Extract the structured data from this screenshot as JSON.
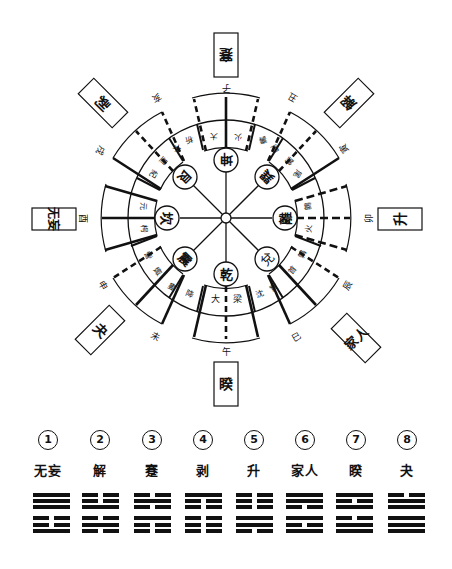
{
  "diagram": {
    "center_trigrams": [
      {
        "name": "坤",
        "position": "top"
      },
      {
        "name": "巽",
        "position": "upper-right"
      },
      {
        "name": "離",
        "position": "right"
      },
      {
        "name": "兌",
        "position": "lower-right"
      },
      {
        "name": "乾",
        "position": "bottom"
      },
      {
        "name": "震",
        "position": "lower-left"
      },
      {
        "name": "坎",
        "position": "left"
      },
      {
        "name": "艮",
        "position": "upper-left"
      }
    ],
    "station_ring": [
      {
        "chars": [
          "大",
          "火"
        ],
        "position": "top"
      },
      {
        "chars": [
          "壽",
          "星"
        ],
        "position": "upper-right-1"
      },
      {
        "chars": [
          "鶉",
          "尾"
        ],
        "position": "upper-right-2"
      },
      {
        "chars": [
          "鶉",
          "火"
        ],
        "position": "right"
      },
      {
        "chars": [
          "鶉",
          "首"
        ],
        "position": "lower-right-1"
      },
      {
        "chars": [
          "實",
          "沈"
        ],
        "position": "lower-right-2"
      },
      {
        "chars": [
          "大",
          "梁"
        ],
        "position": "bottom"
      },
      {
        "chars": [
          "降",
          "婁"
        ],
        "position": "lower-left-1"
      },
      {
        "chars": [
          "娵",
          "訾"
        ],
        "position": "lower-left-2"
      },
      {
        "chars": [
          "元",
          "枵"
        ],
        "position": "left"
      },
      {
        "chars": [
          "星",
          "紀"
        ],
        "position": "upper-left-1"
      },
      {
        "chars": [
          "析",
          "木"
        ],
        "position": "upper-left-2"
      }
    ],
    "branches": {
      "zi": "子",
      "chou": "丑",
      "yin": "寅",
      "mao": "卯",
      "chen": "辰",
      "si": "巳",
      "wu": "午",
      "wei": "未",
      "shen": "申",
      "you": "酉",
      "xu": "戌",
      "hai": "亥"
    },
    "boxes": {
      "top": "蹇",
      "upper_right": "解",
      "right": "升",
      "lower_right": "家人",
      "bottom": "睽",
      "lower_left": "夬",
      "left": "无妄",
      "upper_left": "剥"
    }
  },
  "legend": [
    {
      "number": "1",
      "name": "无妄",
      "lines": [
        "yang",
        "yang",
        "yang",
        "yin",
        "yin",
        "yang"
      ]
    },
    {
      "number": "2",
      "name": "解",
      "lines": [
        "yin",
        "yin",
        "yang",
        "yin",
        "yang",
        "yin"
      ]
    },
    {
      "number": "3",
      "name": "蹇",
      "lines": [
        "yin",
        "yang",
        "yin",
        "yang",
        "yin",
        "yin"
      ]
    },
    {
      "number": "4",
      "name": "剥",
      "lines": [
        "yang",
        "yin",
        "yin",
        "yin",
        "yin",
        "yin"
      ]
    },
    {
      "number": "5",
      "name": "升",
      "lines": [
        "yin",
        "yin",
        "yin",
        "yang",
        "yang",
        "yin"
      ]
    },
    {
      "number": "6",
      "name": "家人",
      "lines": [
        "yang",
        "yang",
        "yin",
        "yang",
        "yin",
        "yang"
      ]
    },
    {
      "number": "7",
      "name": "睽",
      "lines": [
        "yang",
        "yin",
        "yang",
        "yin",
        "yang",
        "yang"
      ]
    },
    {
      "number": "8",
      "name": "夬",
      "lines": [
        "yin",
        "yang",
        "yang",
        "yang",
        "yang",
        "yang"
      ]
    }
  ]
}
